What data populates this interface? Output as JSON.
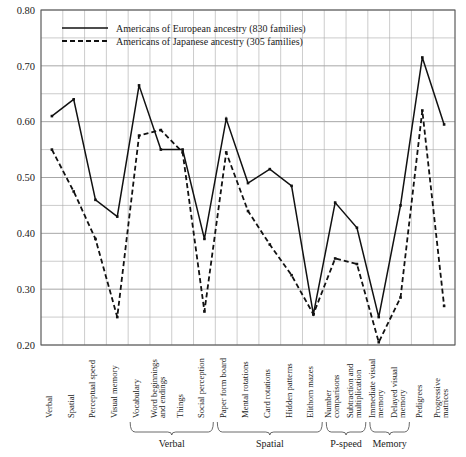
{
  "chart_data": {
    "type": "line",
    "title": "",
    "xlabel": "",
    "ylabel": "",
    "ylim": [
      0.2,
      0.8
    ],
    "ytick_labels": [
      "0.20",
      "0.30",
      "0.40",
      "0.50",
      "0.60",
      "0.70",
      "0.80"
    ],
    "ytick_values": [
      0.2,
      0.3,
      0.4,
      0.5,
      0.6,
      0.7,
      0.8
    ],
    "minor_gridline_step": 0.05,
    "grid": true,
    "legend_position": "top-left",
    "categories": [
      "Verbal",
      "Spatial",
      "Perceptual speed",
      "Visual memory",
      "Vocabulary",
      "Word beginnings and endings",
      "Things",
      "Social perception",
      "Paper form board",
      "Mental rotations",
      "Card rotations",
      "Hidden patterns",
      "Elithorn mazes",
      "Number comparisons",
      "Subtraction and multiplication",
      "Immediate visual memory",
      "Delayed visual memory",
      "Pedigrees",
      "Progressive matrices"
    ],
    "series": [
      {
        "name": "Americans of European ancestry (830 families)",
        "style": "solid",
        "values": [
          0.61,
          0.64,
          0.46,
          0.43,
          0.665,
          0.55,
          0.55,
          0.39,
          0.605,
          0.49,
          0.515,
          0.485,
          0.255,
          0.455,
          0.41,
          0.25,
          0.45,
          0.715,
          0.595
        ]
      },
      {
        "name": "Americans of Japanese ancestry (305 families)",
        "style": "dashed",
        "values": [
          0.55,
          0.475,
          0.39,
          0.25,
          0.575,
          0.585,
          0.545,
          0.26,
          0.545,
          0.44,
          0.38,
          0.325,
          0.255,
          0.355,
          0.345,
          0.205,
          0.285,
          0.62,
          0.27
        ]
      }
    ],
    "groups": [
      {
        "label": "Verbal",
        "start_index": 4,
        "end_index": 7
      },
      {
        "label": "Spatial",
        "start_index": 8,
        "end_index": 12
      },
      {
        "label": "P-speed",
        "start_index": 13,
        "end_index": 14
      },
      {
        "label": "Memory",
        "start_index": 15,
        "end_index": 16
      }
    ],
    "colors": {
      "series": "#111111",
      "grid": "#aaaaaa",
      "frame": "#555555",
      "text": "#1a1a1a"
    }
  }
}
